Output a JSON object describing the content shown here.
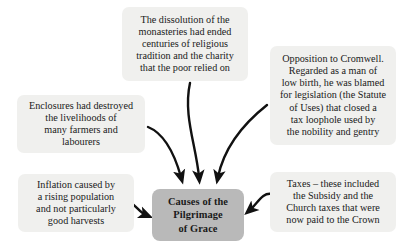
{
  "diagram": {
    "title": "Causes of the Pilgrimage of Grace",
    "type": "spider-cause-diagram",
    "colors": {
      "cause_box_fill": "#f0f0ee",
      "center_box_fill": "#b9b9b9",
      "text": "#1a1a1a",
      "arrow": "#111111",
      "background": "#ffffff"
    },
    "center": {
      "id": "center",
      "label": "Causes of the\nPilgrimage\nof Grace"
    },
    "causes": [
      {
        "id": "dissolution",
        "label": "The dissolution of the\nmonasteries had ended\ncenturies of religious\ntradition and the charity\nthat the poor relied on",
        "position": "top"
      },
      {
        "id": "cromwell",
        "label": "Opposition to Cromwell.\nRegarded as a man of\nlow birth, he was blamed\nfor legislation (the Statute\nof Uses) that closed a\ntax loophole used by\nthe nobility and gentry",
        "position": "top-right"
      },
      {
        "id": "enclosures",
        "label": "Enclosures had destroyed\nthe livelihoods of\nmany farmers and\nlabourers",
        "position": "left"
      },
      {
        "id": "inflation",
        "label": "Inflation caused by\na rising population\nand not particularly\ngood harvests",
        "position": "bottom-left"
      },
      {
        "id": "taxes",
        "label": "Taxes – these included\nthe Subsidy and the\nChurch taxes that were\nnow paid to the Crown",
        "position": "bottom-right"
      }
    ],
    "arrows": [
      {
        "id": "arrow-enclosures-to-center",
        "from": "enclosures",
        "to": "center"
      },
      {
        "id": "arrow-dissolution-to-center",
        "from": "dissolution",
        "to": "center"
      },
      {
        "id": "arrow-cromwell-to-center",
        "from": "cromwell",
        "to": "center"
      },
      {
        "id": "arrow-inflation-to-center",
        "from": "inflation",
        "to": "center"
      },
      {
        "id": "arrow-taxes-to-center",
        "from": "taxes",
        "to": "center"
      }
    ]
  }
}
